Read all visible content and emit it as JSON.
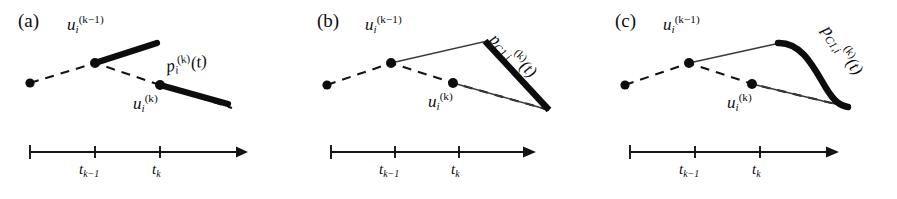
{
  "figure": {
    "type": "diagram",
    "background_color": "#ffffff",
    "ink_color": "#0d0d0d",
    "width": 897,
    "height": 199
  },
  "axis": {
    "tick_labels": [
      "t_k-1",
      "t_k"
    ],
    "tick_label_prev": "t",
    "tick_label_prev_sub": "k−1",
    "tick_label_cur": "t",
    "tick_label_cur_sub": "k",
    "arrow_direction": "right",
    "label_axis_name": "t"
  },
  "panels": [
    {
      "id": "a",
      "tag": "(a)",
      "knot_label_prev": "u",
      "knot_label_prev_sub": "i",
      "knot_label_prev_sup": "(k−1)",
      "knot_label_cur": "u",
      "knot_label_cur_sub": "i",
      "knot_label_cur_sup": "(k)",
      "path_label_base": "p",
      "path_label_sub": "i",
      "path_label_sup": "(k)",
      "path_label_arg": "(t)",
      "continuity": "discontinuous",
      "path_style": "two disjoint thick segments",
      "control_polyline": "dashed with round knots"
    },
    {
      "id": "b",
      "tag": "(b)",
      "knot_label_prev": "u",
      "knot_label_prev_sub": "i",
      "knot_label_prev_sup": "(k−1)",
      "knot_label_cur": "u",
      "knot_label_cur_sub": "i",
      "knot_label_cur_sup": "(k)",
      "path_label_base": "p",
      "path_label_sub": "C1,i",
      "path_label_sup": "(k)",
      "path_label_arg": "(t)",
      "continuity": "C0 position continuous, corner",
      "path_style": "thin construction polyline with thick descending segment",
      "control_polyline": "dashed with round knots"
    },
    {
      "id": "c",
      "tag": "(c)",
      "knot_label_prev": "u",
      "knot_label_prev_sub": "i",
      "knot_label_prev_sup": "(k−1)",
      "knot_label_cur": "u",
      "knot_label_cur_sub": "i",
      "knot_label_cur_sup": "(k)",
      "path_label_base": "p",
      "path_label_sub": "C1,i",
      "path_label_sup": "(k)",
      "path_label_arg": "(t)",
      "continuity": "C1 tangent continuous, smooth",
      "path_style": "thin construction polyline with thick smooth blended curve",
      "control_polyline": "dashed with round knots"
    }
  ]
}
